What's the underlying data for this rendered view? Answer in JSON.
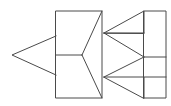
{
  "figure": {
    "kind": "line-drawing",
    "canvas": {
      "width": 171,
      "height": 106
    },
    "colors": {
      "background": "#ffffff",
      "stroke": "#4a4a4a"
    },
    "stroke_width": 1,
    "shapes": [
      {
        "name": "left-arrow-triangle",
        "type": "polyline",
        "closed": false,
        "points": [
          [
            56,
            36
          ],
          [
            12,
            55
          ],
          [
            56,
            75
          ]
        ]
      },
      {
        "name": "middle-rectangle",
        "type": "rect",
        "x": 56,
        "y": 11,
        "width": 46,
        "height": 87
      },
      {
        "name": "middle-rectangle-divider",
        "type": "line",
        "points": [
          [
            56,
            55
          ],
          [
            82,
            55
          ]
        ]
      },
      {
        "name": "middle-y-upper-branch",
        "type": "line",
        "points": [
          [
            82,
            55
          ],
          [
            102,
            11
          ]
        ]
      },
      {
        "name": "middle-y-lower-branch",
        "type": "line",
        "points": [
          [
            82,
            55
          ],
          [
            102,
            98
          ]
        ]
      },
      {
        "name": "upper-right-triangle",
        "type": "polyline",
        "closed": true,
        "points": [
          [
            104,
            33
          ],
          [
            144,
            11
          ],
          [
            144,
            33
          ]
        ]
      },
      {
        "name": "lower-right-triangle",
        "type": "polyline",
        "closed": true,
        "points": [
          [
            104,
            77
          ],
          [
            144,
            77
          ],
          [
            144,
            98
          ]
        ]
      },
      {
        "name": "upper-vertex-to-mid-line",
        "type": "line",
        "points": [
          [
            104,
            33
          ],
          [
            144,
            57
          ]
        ]
      },
      {
        "name": "lower-vertex-to-mid-line",
        "type": "line",
        "points": [
          [
            104,
            77
          ],
          [
            144,
            57
          ]
        ]
      },
      {
        "name": "right-rectangle",
        "type": "rect",
        "x": 144,
        "y": 11,
        "width": 22,
        "height": 87
      },
      {
        "name": "right-rectangle-divider-upper",
        "type": "line",
        "points": [
          [
            144,
            57
          ],
          [
            166,
            57
          ]
        ]
      },
      {
        "name": "right-rectangle-divider-lower",
        "type": "line",
        "points": [
          [
            144,
            77
          ],
          [
            166,
            77
          ]
        ]
      },
      {
        "name": "upper-connector-to-right-rect",
        "type": "line",
        "points": [
          [
            104,
            33
          ],
          [
            144,
            33
          ]
        ]
      }
    ]
  }
}
